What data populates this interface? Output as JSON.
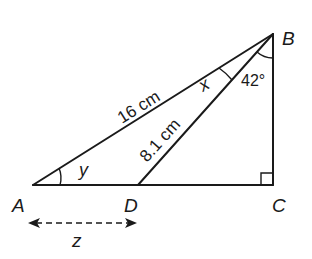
{
  "diagram": {
    "type": "right-triangle-geometry",
    "points": {
      "A": {
        "label": "A"
      },
      "B": {
        "label": "B"
      },
      "C": {
        "label": "C"
      },
      "D": {
        "label": "D"
      }
    },
    "segments": {
      "AB": {
        "label": "16 cm"
      },
      "DB": {
        "label": "8.1 cm"
      },
      "AD": {
        "label": "z"
      }
    },
    "angles": {
      "A": {
        "label": "y"
      },
      "ABD": {
        "label": "x"
      },
      "DBC": {
        "label": "42°"
      },
      "C": {
        "label": "right-angle"
      }
    }
  }
}
